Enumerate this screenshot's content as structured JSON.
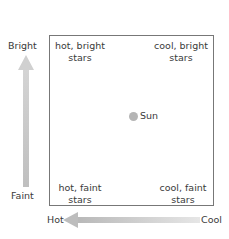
{
  "axes": {
    "y": {
      "top_label": "Bright",
      "bottom_label": "Faint"
    },
    "x": {
      "left_label": "Hot",
      "right_label": "Cool"
    }
  },
  "quadrants": {
    "top_left": [
      "hot, bright",
      "stars"
    ],
    "top_right": [
      "cool, bright",
      "stars"
    ],
    "bottom_left": [
      "hot, faint",
      "stars"
    ],
    "bottom_right": [
      "cool, faint",
      "stars"
    ]
  },
  "marker": {
    "label": "Sun",
    "color": "#b5b5b5"
  },
  "colors": {
    "arrow": "#bdbdbd",
    "box_border": "#777777"
  }
}
